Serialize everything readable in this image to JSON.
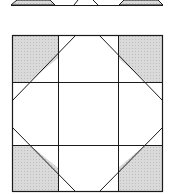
{
  "diagram": {
    "type": "quilt-block",
    "colors": {
      "line": "#1a1a1a",
      "shade": "#d4d4d4",
      "background": "#ffffff"
    },
    "top_strip": {
      "baseline_y": 5,
      "x_start": 11,
      "x_end": 163
    },
    "block": {
      "left": 12,
      "top": 35,
      "right": 163,
      "bottom": 192,
      "v_lines": [
        58,
        118
      ],
      "h_lines": [
        82,
        145
      ]
    }
  }
}
